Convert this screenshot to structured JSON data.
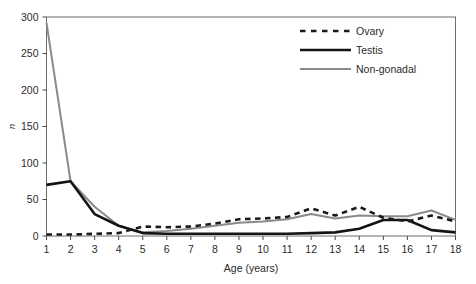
{
  "chart_data": {
    "type": "line",
    "title": "",
    "xlabel": "Age (years)",
    "ylabel": "n",
    "x": [
      1,
      2,
      3,
      4,
      5,
      6,
      7,
      8,
      9,
      10,
      11,
      12,
      13,
      14,
      15,
      16,
      17,
      18
    ],
    "xtick_labels": [
      "1",
      "2",
      "3",
      "4",
      "5",
      "6",
      "7",
      "8",
      "9",
      "10",
      "11",
      "12",
      "13",
      "14",
      "15",
      "16",
      "17",
      "18"
    ],
    "ytick_labels": [
      "0",
      "50",
      "100",
      "150",
      "200",
      "250",
      "300"
    ],
    "yticks": [
      0,
      50,
      100,
      150,
      200,
      250,
      300
    ],
    "xlim": [
      1,
      18
    ],
    "ylim": [
      0,
      300
    ],
    "grid": false,
    "legend_position": "top-right",
    "series": [
      {
        "name": "Ovary",
        "style": "dashed",
        "color": "#1a1a1a",
        "width": 2.6,
        "values": [
          2,
          2,
          3,
          4,
          13,
          12,
          13,
          17,
          23,
          24,
          26,
          38,
          28,
          40,
          25,
          20,
          28,
          20
        ]
      },
      {
        "name": "Testis",
        "style": "solid",
        "color": "#141414",
        "width": 2.6,
        "values": [
          70,
          75,
          30,
          14,
          4,
          3,
          3,
          3,
          3,
          3,
          3,
          4,
          5,
          10,
          22,
          22,
          8,
          5
        ]
      },
      {
        "name": "Non-gonadal",
        "style": "solid",
        "color": "#8a8a8a",
        "width": 2.0,
        "values": [
          292,
          75,
          40,
          14,
          5,
          7,
          10,
          14,
          18,
          20,
          23,
          30,
          24,
          28,
          27,
          27,
          35,
          22
        ]
      }
    ]
  },
  "axes": {
    "y_title": "n",
    "x_title": "Age (years)"
  },
  "legend": {
    "items": [
      {
        "label": "Ovary"
      },
      {
        "label": "Testis"
      },
      {
        "label": "Non-gonadal"
      }
    ]
  }
}
